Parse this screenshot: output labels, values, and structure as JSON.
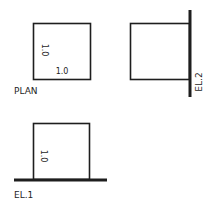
{
  "views": {
    "plan": {
      "title": "PLAN",
      "side_label": "1.0",
      "bottom_label": "1.0"
    },
    "elevation_2": {
      "title": "EL.2"
    },
    "elevation_1": {
      "title": "EL.1",
      "side_label": "1.0"
    }
  },
  "colors": {
    "ink": "#1e1e1e",
    "background": "#ffffff"
  }
}
